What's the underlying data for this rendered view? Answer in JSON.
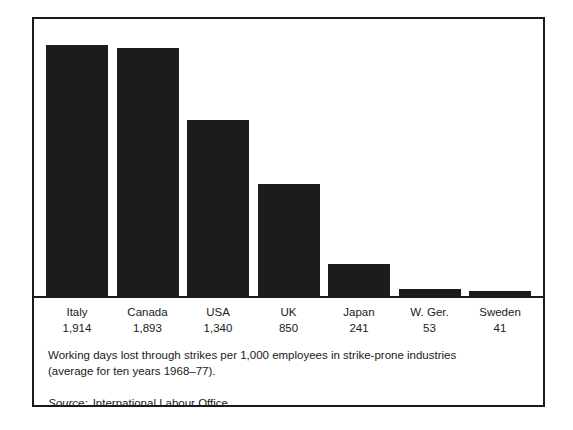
{
  "chart_data": {
    "type": "bar",
    "title": "",
    "xlabel": "",
    "ylabel": "",
    "categories": [
      "Italy",
      "Canada",
      "USA",
      "UK",
      "Japan",
      "W. Ger.",
      "Sweden"
    ],
    "values": [
      1914,
      1893,
      1340,
      850,
      241,
      53,
      41
    ],
    "value_labels": [
      "1,914",
      "1,893",
      "1,340",
      "850",
      "241",
      "53",
      "41"
    ],
    "ylim": [
      0,
      2050
    ],
    "grid": false,
    "legend": "none",
    "bar_color": "#1c1c1c",
    "axis_color": "#1a1a1a",
    "background": "#ffffff",
    "caption": "Working days lost through strikes per 1,000 employees in strike-prone industries (average for ten years 1968–77).",
    "source_label": "Source:",
    "source_text": "International Labour Office."
  },
  "figure": {
    "caption_line": "Working days lost through strikes per 1,000 employees in strike-prone industries (average for ten years 1968–77).",
    "source_label": "Source:",
    "source_text": "International Labour Office."
  }
}
